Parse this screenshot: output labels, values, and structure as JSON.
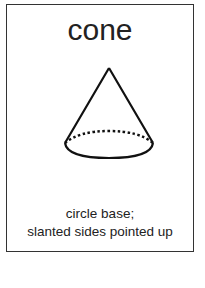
{
  "card": {
    "title": "cone",
    "shape": "cone-icon",
    "description_line1": "circle base;",
    "description_line2": "slanted sides pointed up"
  }
}
